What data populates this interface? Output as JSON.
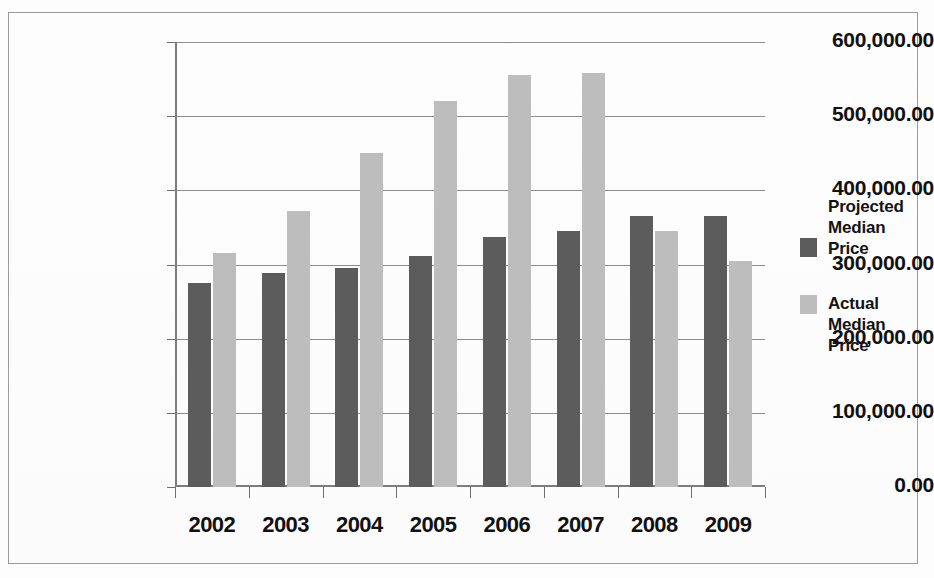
{
  "chart_data": {
    "type": "bar",
    "title": "",
    "xlabel": "",
    "ylabel": "",
    "categories": [
      "2002",
      "2003",
      "2004",
      "2005",
      "2006",
      "2007",
      "2008",
      "2009"
    ],
    "series": [
      {
        "name": "Projected Median Price",
        "color": "#5c5c5c",
        "values": [
          275000,
          289000,
          295000,
          312000,
          337000,
          345000,
          365000,
          365000
        ]
      },
      {
        "name": "Actual Median Price",
        "color": "#bdbdbd",
        "values": [
          316000,
          372000,
          450000,
          521000,
          555000,
          558000,
          345000,
          305000
        ]
      }
    ],
    "ylim": [
      0,
      600000
    ],
    "ytick_values": [
      0,
      100000,
      200000,
      300000,
      400000,
      500000,
      600000
    ],
    "ytick_labels": [
      "0.00",
      "100,000.00",
      "200,000.00",
      "300,000.00",
      "400,000.00",
      "500,000.00",
      "600,000.00"
    ],
    "grid": true,
    "legend_position": "right"
  },
  "legend": {
    "entries": [
      {
        "label_line1": "Projected",
        "label_line2": "Median",
        "label_line3": "Price",
        "swatch": "projected-swatch"
      },
      {
        "label_line1": "Actual",
        "label_line2": "Median",
        "label_line3": "Price",
        "swatch": "actual-swatch"
      }
    ]
  }
}
